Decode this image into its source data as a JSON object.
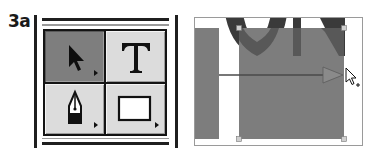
{
  "figure": {
    "step_label": "3a"
  },
  "tool_palette": {
    "tools": [
      {
        "name": "Selection Tool",
        "icon": "selection-arrow-icon",
        "selected": true,
        "has_flyout": true
      },
      {
        "name": "Type Tool",
        "icon": "type-icon",
        "glyph": "T",
        "selected": false,
        "has_flyout": false
      },
      {
        "name": "Pen Tool",
        "icon": "pen-icon",
        "selected": false,
        "has_flyout": true
      },
      {
        "name": "Rectangle Tool",
        "icon": "rectangle-icon",
        "selected": false,
        "has_flyout": true
      }
    ]
  },
  "canvas": {
    "background": "#ffffff",
    "shape_fill": "#7d7d7d",
    "letter_fill": "#3a3a3a",
    "handle_color": "#c8c8c8",
    "drag_arrow": "horizontal drag from left rectangle to right edge of selected rectangle",
    "cursor": "selection-arrow-with-plus"
  },
  "colors": {
    "palette_bg": "#dcdcdc",
    "palette_active": "#7e7e7e",
    "frame": "#1f1f1f"
  }
}
